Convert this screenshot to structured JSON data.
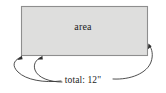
{
  "figure": {
    "type": "geometry-diagram",
    "width": 166,
    "height": 93,
    "background_color": "#ffffff",
    "shape": {
      "name": "rectangle",
      "label": "area",
      "fill_color": "#dededd",
      "stroke_color": "#8e8e8e",
      "x": 21,
      "y": 6,
      "width": 127,
      "height": 50
    },
    "measurement": {
      "label": "total: 12\"",
      "value": 12,
      "unit": "inches",
      "unit_symbol": "\"",
      "prefix": "total:"
    },
    "leaders": [
      {
        "name": "leader-left-outer",
        "target": "rectangle-bottom-left-corner",
        "has_arrowhead": true
      },
      {
        "name": "leader-left-inner",
        "target": "rectangle-bottom-edge",
        "has_arrowhead": true
      },
      {
        "name": "leader-right",
        "target": "rectangle-right-edge",
        "has_arrowhead": true
      }
    ]
  }
}
